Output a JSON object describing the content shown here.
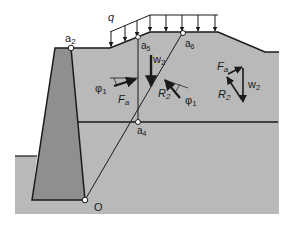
{
  "diagram": {
    "type": "retaining-wall-wedge-analysis",
    "colors": {
      "background": "#ffffff",
      "soil": "#b9b9b9",
      "wall": "#8f8f8f",
      "lines": "#1a1a1a",
      "point_fill": "#ffffff"
    },
    "labels": {
      "surcharge": "q",
      "point_a2": "a",
      "point_a2_sub": "2",
      "point_a5": "a",
      "point_a5_sub": "5",
      "point_a6": "a",
      "point_a6_sub": "6",
      "point_a4": "a",
      "point_a4_sub": "4",
      "point_o": "O",
      "w2_wedge": "w",
      "w2_wedge_sub": "2",
      "phi1_left": "φ",
      "phi1_left_sub": "1",
      "fa_wedge": "F",
      "fa_wedge_sub": "a",
      "r2_wedge": "R",
      "r2_wedge_sub": "2",
      "phi1_right": "φ",
      "phi1_right_sub": "1",
      "fa_polygon": "F",
      "fa_polygon_sub": "a",
      "w2_polygon": "w",
      "w2_polygon_sub": "2",
      "r2_polygon": "R",
      "r2_polygon_sub": "2"
    },
    "surcharge_arrow_count": 8
  }
}
